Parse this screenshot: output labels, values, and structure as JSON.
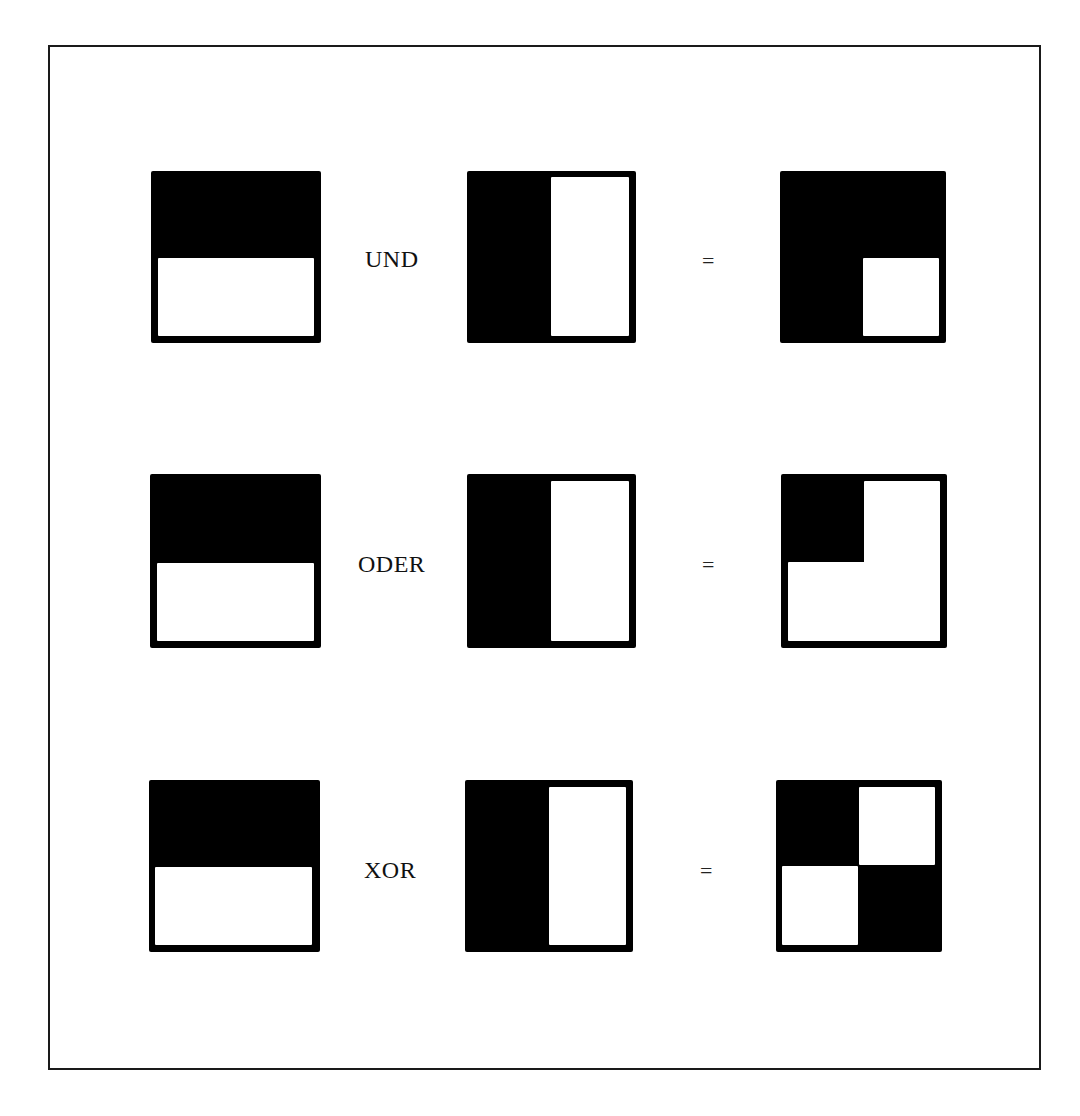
{
  "diagram": {
    "rows": [
      {
        "operator": "UND",
        "equals": "=",
        "operand_a": "top-half-black",
        "operand_b": "left-half-black",
        "result": "all-black-except-bottom-right"
      },
      {
        "operator": "ODER",
        "equals": "=",
        "operand_a": "top-half-black",
        "operand_b": "left-half-black",
        "result": "only-top-left-black"
      },
      {
        "operator": "XOR",
        "equals": "=",
        "operand_a": "top-half-black",
        "operand_b": "left-half-black",
        "result": "checkerboard-top-left-bottom-right-black"
      }
    ],
    "colors": {
      "foreground": "#000000",
      "background": "#ffffff",
      "frame": "#1a1a1a"
    }
  }
}
